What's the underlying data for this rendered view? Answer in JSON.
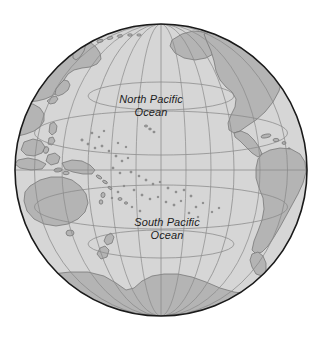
{
  "figure": {
    "type": "orthographic-globe-map",
    "region": "Pacific Ocean",
    "background_color": "#ffffff"
  },
  "labels": {
    "north_pacific": {
      "line1": "North Pacific",
      "line2": "Ocean"
    },
    "south_pacific": {
      "line1": "South Pacific",
      "line2": "Ocean"
    }
  },
  "colors": {
    "ocean_fill": "#d6d6d6",
    "land_fill": "#b4b4b4",
    "land_stroke": "#707070",
    "graticule": "#8e8e8e",
    "globe_outline": "#1a1a1a",
    "background": "#ffffff",
    "label_text": "#1c1c1c"
  },
  "geometry": {
    "center_x": 161,
    "center_y": 170,
    "radius": 147,
    "graticule_spacing_degrees": 30,
    "projection": "orthographic",
    "center_longitude": 180,
    "center_latitude": 0
  },
  "graticule": {
    "parallels_degrees": [
      -60,
      -30,
      0,
      30,
      60
    ],
    "meridians_degrees": [
      120,
      150,
      180,
      210,
      240
    ]
  },
  "landmasses": [
    "Asia",
    "Japan",
    "Australia",
    "New Zealand",
    "New Guinea",
    "Indonesia",
    "North America",
    "Central America",
    "South America",
    "Antarctica",
    "Pacific Islands"
  ]
}
